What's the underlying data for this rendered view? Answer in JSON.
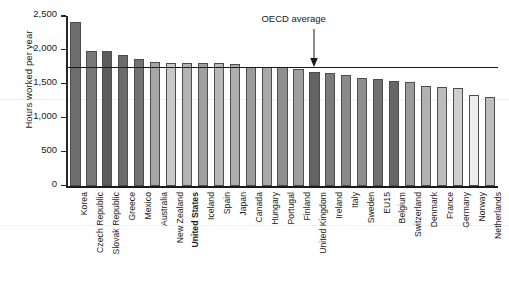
{
  "chart_data": {
    "type": "bar",
    "title": "",
    "xlabel": "",
    "ylabel": "Hours worked per year",
    "ylim": [
      0,
      2500
    ],
    "yticks": [
      0,
      500,
      1000,
      1500,
      2000,
      2500
    ],
    "ytick_labels": [
      "0",
      "500",
      "1,000",
      "1,500",
      "2,000",
      "2,500"
    ],
    "grid": false,
    "legend": "none",
    "categories": [
      "Korea",
      "Czech Republic",
      "Slovak Republic",
      "Greece",
      "Mexico",
      "Australia",
      "New Zealand",
      "United States",
      "Iceland",
      "Spain",
      "Japan",
      "Canada",
      "Hungary",
      "Portugal",
      "Finland",
      "United Kingdom",
      "Ireland",
      "Italy",
      "Sweden",
      "EU15",
      "Belgium",
      "Switzerland",
      "Denmark",
      "France",
      "Germany",
      "Norway",
      "Netherlands"
    ],
    "values": [
      2410,
      1986,
      1979,
      1925,
      1871,
      1814,
      1812,
      1804,
      1800,
      1799,
      1789,
      1751,
      1750,
      1742,
      1719,
      1673,
      1658,
      1624,
      1587,
      1570,
      1543,
      1532,
      1475,
      1453,
      1437,
      1337,
      1309
    ],
    "bar_shades": [
      "#6e6e6e",
      "#787878",
      "#5c5c5c",
      "#6b6b6b",
      "#747474",
      "#a6a6a6",
      "#c9c9c9",
      "#b3b3b3",
      "#a0a0a0",
      "#b8b8b8",
      "#aeaeae",
      "#9b9b9b",
      "#a8a8a8",
      "#8f8f8f",
      "#9e9e9e",
      "#636363",
      "#7b7b7b",
      "#8a8a8a",
      "#8e8e8e",
      "#707070",
      "#676767",
      "#9a9a9a",
      "#b1b1b1",
      "#bcbcbc",
      "#cfcfcf",
      "#ededed",
      "#bdbdbd"
    ],
    "annotations": [
      {
        "name": "oecd-average",
        "label": "OECD average",
        "value": 1750,
        "points_to": "United Kingdom",
        "line_style": "solid",
        "line_color": "#1a1a1a"
      }
    ]
  },
  "axis": {
    "y_title": "Hours worked per year"
  },
  "annotation": {
    "oecd_label": "OECD average"
  }
}
